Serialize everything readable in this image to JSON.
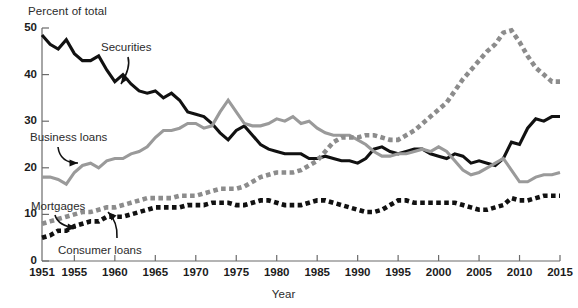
{
  "chart_data": {
    "type": "line",
    "title": "",
    "subtitle": "",
    "xlabel": "Year",
    "ylabel": "Percent of total",
    "xlim": [
      1951,
      2015
    ],
    "ylim": [
      0,
      50
    ],
    "ytick_labels": [
      "0",
      "10",
      "20",
      "30",
      "40",
      "50"
    ],
    "yticks": [
      0,
      10,
      20,
      30,
      40,
      50
    ],
    "xtick_labels": [
      "1951",
      "1955",
      "1960",
      "1965",
      "1970",
      "1975",
      "1980",
      "1985",
      "1990",
      "1995",
      "2000",
      "2005",
      "2010",
      "2015"
    ],
    "xticks": [
      1951,
      1955,
      1960,
      1965,
      1970,
      1975,
      1980,
      1985,
      1990,
      1995,
      2000,
      2005,
      2010,
      2015
    ],
    "grid": false,
    "legend_position": "inline-annotations",
    "x": [
      1951,
      1952,
      1953,
      1954,
      1955,
      1956,
      1957,
      1958,
      1959,
      1960,
      1961,
      1962,
      1963,
      1964,
      1965,
      1966,
      1967,
      1968,
      1969,
      1970,
      1971,
      1972,
      1973,
      1974,
      1975,
      1976,
      1977,
      1978,
      1979,
      1980,
      1981,
      1982,
      1983,
      1984,
      1985,
      1986,
      1987,
      1988,
      1989,
      1990,
      1991,
      1992,
      1993,
      1994,
      1995,
      1996,
      1997,
      1998,
      1999,
      2000,
      2001,
      2002,
      2003,
      2004,
      2005,
      2006,
      2007,
      2008,
      2009,
      2010,
      2011,
      2012,
      2013,
      2014,
      2015
    ],
    "series": [
      {
        "name": "Securities",
        "color": "#111111",
        "style": "solid",
        "label_text": "Securities",
        "values": [
          48.5,
          46.5,
          45.5,
          47.5,
          44.5,
          43.0,
          43.0,
          44.0,
          41.0,
          38.5,
          40.0,
          38.0,
          36.5,
          36.0,
          36.5,
          35.0,
          36.0,
          34.5,
          32.0,
          31.5,
          31.0,
          29.5,
          27.5,
          26.0,
          28.0,
          29.0,
          27.0,
          25.0,
          24.0,
          23.5,
          23.0,
          23.0,
          23.0,
          22.0,
          22.0,
          22.5,
          22.0,
          21.5,
          21.5,
          21.0,
          22.0,
          24.0,
          24.5,
          23.5,
          23.0,
          23.5,
          24.0,
          24.0,
          23.0,
          22.5,
          22.0,
          23.0,
          22.5,
          21.0,
          21.5,
          21.0,
          20.5,
          22.0,
          25.5,
          25.0,
          28.5,
          30.5,
          30.0,
          31.0,
          31.0
        ]
      },
      {
        "name": "Business loans",
        "color": "#9a9a9a",
        "style": "solid",
        "label_text": "Business loans",
        "values": [
          18.0,
          18.0,
          17.5,
          16.5,
          19.0,
          20.5,
          21.0,
          20.0,
          21.5,
          22.0,
          22.0,
          23.0,
          23.5,
          24.5,
          26.5,
          28.0,
          28.0,
          28.5,
          29.5,
          29.5,
          28.5,
          29.0,
          32.0,
          34.5,
          32.0,
          29.5,
          29.0,
          29.0,
          29.5,
          30.5,
          30.0,
          31.0,
          29.5,
          30.0,
          28.5,
          27.5,
          27.0,
          27.0,
          27.0,
          26.0,
          25.0,
          23.5,
          22.5,
          22.5,
          23.0,
          23.0,
          23.5,
          24.0,
          23.5,
          24.5,
          23.5,
          21.5,
          19.5,
          18.5,
          19.0,
          20.0,
          21.0,
          22.0,
          19.5,
          17.0,
          17.0,
          18.0,
          18.5,
          18.5,
          19.0
        ]
      },
      {
        "name": "Mortgages",
        "color": "#8c8c8c",
        "style": "dashed",
        "label_text": "Mortgages",
        "values": [
          8.0,
          8.5,
          9.0,
          9.5,
          10.0,
          10.5,
          10.5,
          11.0,
          11.5,
          11.5,
          12.0,
          12.5,
          13.0,
          13.5,
          13.5,
          13.5,
          13.5,
          14.0,
          14.0,
          14.0,
          14.5,
          15.0,
          15.5,
          15.5,
          15.5,
          16.0,
          17.0,
          18.0,
          18.5,
          19.0,
          19.0,
          19.0,
          19.5,
          20.5,
          21.5,
          23.5,
          25.5,
          26.5,
          26.5,
          26.5,
          27.0,
          27.0,
          26.5,
          26.0,
          26.0,
          27.0,
          28.0,
          29.5,
          31.0,
          32.5,
          34.0,
          36.5,
          39.0,
          41.0,
          43.0,
          45.0,
          46.5,
          49.0,
          49.5,
          47.0,
          44.0,
          41.5,
          40.0,
          38.5,
          38.5
        ]
      },
      {
        "name": "Consumer loans",
        "color": "#111111",
        "style": "dashed",
        "label_text": "Consumer loans",
        "values": [
          5.0,
          5.5,
          6.5,
          6.5,
          7.5,
          8.0,
          8.5,
          8.5,
          9.5,
          9.5,
          9.5,
          10.0,
          10.5,
          11.0,
          11.5,
          11.5,
          11.5,
          11.5,
          12.0,
          12.0,
          12.0,
          12.5,
          12.5,
          12.5,
          12.0,
          12.0,
          12.5,
          13.0,
          13.0,
          12.5,
          12.0,
          12.0,
          12.0,
          12.5,
          13.0,
          13.0,
          12.5,
          12.0,
          11.5,
          11.0,
          10.5,
          10.5,
          11.0,
          12.0,
          13.0,
          13.0,
          12.5,
          12.5,
          12.5,
          12.5,
          12.5,
          12.5,
          12.0,
          11.5,
          11.0,
          11.0,
          11.5,
          12.0,
          13.5,
          13.0,
          13.0,
          13.5,
          14.0,
          14.0,
          14.0
        ]
      }
    ],
    "annotations": [
      {
        "text": "Securities",
        "target_series": "Securities"
      },
      {
        "text": "Business loans",
        "target_series": "Business loans"
      },
      {
        "text": "Mortgages",
        "target_series": "Mortgages"
      },
      {
        "text": "Consumer loans",
        "target_series": "Consumer loans"
      }
    ]
  }
}
